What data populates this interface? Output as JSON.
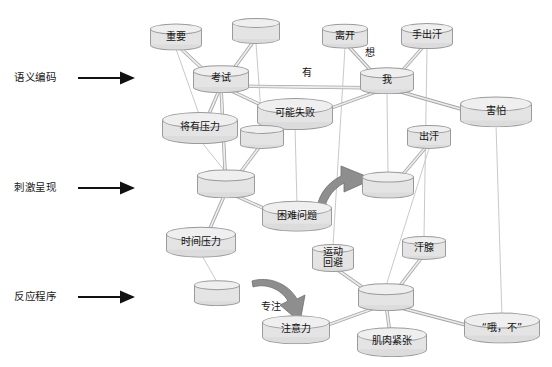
{
  "diagram": {
    "background": "#ffffff",
    "node_fill": "#e8e8e8",
    "node_stroke": "#9a9a9a",
    "edge_color": "#b9b9b9",
    "arrow_color": "#111111",
    "curved_arrow_fill": "#8c8c8c"
  },
  "stage_labels": [
    {
      "text": "语义编码",
      "x": 14,
      "y": 78
    },
    {
      "text": "刺激呈现",
      "x": 14,
      "y": 188
    },
    {
      "text": "反应程序",
      "x": 14,
      "y": 297
    }
  ],
  "arrows": [
    {
      "name": "stage-arrow-semantic-encoding",
      "x1": 78,
      "y1": 78,
      "x2": 133,
      "y2": 78
    },
    {
      "name": "stage-arrow-stimulus-presentation",
      "x1": 78,
      "y1": 188,
      "x2": 133,
      "y2": 188
    },
    {
      "name": "stage-arrow-response-procedure",
      "x1": 78,
      "y1": 297,
      "x2": 133,
      "y2": 297
    }
  ],
  "nodes": [
    {
      "id": "n_important",
      "label": "重要",
      "x": 176,
      "y": 37,
      "rx": 26,
      "h": 16
    },
    {
      "id": "n_blank_top",
      "label": "",
      "x": 256,
      "y": 31,
      "rx": 24,
      "h": 16
    },
    {
      "id": "n_leave",
      "label": "离开",
      "x": 345,
      "y": 36,
      "rx": 23,
      "h": 15
    },
    {
      "id": "n_sweatyhand",
      "label": "手出汗",
      "x": 427,
      "y": 36,
      "rx": 26,
      "h": 15
    },
    {
      "id": "n_exam",
      "label": "考试",
      "x": 221,
      "y": 79,
      "rx": 28,
      "h": 16
    },
    {
      "id": "n_me",
      "label": "我",
      "x": 387,
      "y": 81,
      "rx": 27,
      "h": 16
    },
    {
      "id": "n_mayfail",
      "label": "可能失败",
      "x": 295,
      "y": 114,
      "rx": 38,
      "h": 16
    },
    {
      "id": "n_afraid",
      "label": "害怕",
      "x": 496,
      "y": 112,
      "rx": 36,
      "h": 16
    },
    {
      "id": "n_pressure",
      "label": "将有压力",
      "x": 200,
      "y": 128,
      "rx": 38,
      "h": 16
    },
    {
      "id": "n_blank_mid1",
      "label": "",
      "x": 262,
      "y": 137,
      "rx": 22,
      "h": 15
    },
    {
      "id": "n_sweat",
      "label": "出汗",
      "x": 429,
      "y": 137,
      "rx": 22,
      "h": 15
    },
    {
      "id": "n_blank_mid2",
      "label": "",
      "x": 226,
      "y": 184,
      "rx": 29,
      "h": 17
    },
    {
      "id": "n_blank_mid3",
      "label": "",
      "x": 388,
      "y": 185,
      "rx": 26,
      "h": 16
    },
    {
      "id": "n_hardprob",
      "label": "困难问题",
      "x": 297,
      "y": 216,
      "rx": 35,
      "h": 16
    },
    {
      "id": "n_timepress",
      "label": "时间压力",
      "x": 201,
      "y": 242,
      "rx": 35,
      "h": 16
    },
    {
      "id": "n_avoid",
      "label": "运动\n回避",
      "x": 333,
      "y": 258,
      "rx": 21,
      "h": 19
    },
    {
      "id": "n_sweatgland",
      "label": "汗腺",
      "x": 424,
      "y": 248,
      "rx": 22,
      "h": 15
    },
    {
      "id": "n_blank_bot",
      "label": "",
      "x": 217,
      "y": 293,
      "rx": 23,
      "h": 16
    },
    {
      "id": "n_blank_hub",
      "label": "",
      "x": 386,
      "y": 297,
      "rx": 28,
      "h": 16
    },
    {
      "id": "n_attention",
      "label": "注意力",
      "x": 296,
      "y": 330,
      "rx": 34,
      "h": 15
    },
    {
      "id": "n_muscle",
      "label": "肌肉紧张",
      "x": 392,
      "y": 342,
      "rx": 35,
      "h": 15
    },
    {
      "id": "n_ohno",
      "label": "“哦，不”",
      "x": 502,
      "y": 328,
      "rx": 38,
      "h": 15
    }
  ],
  "edges": [
    {
      "from": "n_important",
      "to": "n_exam"
    },
    {
      "from": "n_blank_top",
      "to": "n_exam"
    },
    {
      "from": "n_exam",
      "to": "n_me"
    },
    {
      "from": "n_leave",
      "to": "n_me"
    },
    {
      "from": "n_sweatyhand",
      "to": "n_me"
    },
    {
      "from": "n_exam",
      "to": "n_mayfail"
    },
    {
      "from": "n_mayfail",
      "to": "n_me"
    },
    {
      "from": "n_me",
      "to": "n_afraid"
    },
    {
      "from": "n_exam",
      "to": "n_pressure"
    },
    {
      "from": "n_exam",
      "to": "n_blank_mid2"
    },
    {
      "from": "n_blank_mid1",
      "to": "n_blank_mid2"
    },
    {
      "from": "n_blank_mid2",
      "to": "n_hardprob"
    },
    {
      "from": "n_blank_mid2",
      "to": "n_timepress"
    },
    {
      "from": "n_blank_mid3",
      "to": "n_sweat"
    },
    {
      "from": "n_avoid",
      "to": "n_blank_hub"
    },
    {
      "from": "n_sweatgland",
      "to": "n_blank_hub"
    },
    {
      "from": "n_blank_hub",
      "to": "n_attention"
    },
    {
      "from": "n_blank_hub",
      "to": "n_muscle"
    },
    {
      "from": "n_blank_hub",
      "to": "n_ohno"
    }
  ],
  "vertical_links": [
    {
      "from": "n_important",
      "to": "n_pressure"
    },
    {
      "from": "n_blank_top",
      "to": "n_blank_mid1"
    },
    {
      "from": "n_leave",
      "to": "n_avoid"
    },
    {
      "from": "n_sweatyhand",
      "to": "n_sweatgland"
    },
    {
      "from": "n_mayfail",
      "to": "n_hardprob"
    },
    {
      "from": "n_me",
      "to": "n_blank_mid3"
    },
    {
      "from": "n_afraid",
      "to": "n_ohno"
    },
    {
      "from": "n_pressure",
      "to": "n_blank_mid2"
    },
    {
      "from": "n_sweat",
      "to": "n_blank_hub"
    },
    {
      "from": "n_timepress",
      "to": "n_blank_bot"
    },
    {
      "from": "n_exam",
      "to": "n_blank_mid2"
    }
  ],
  "edge_labels": [
    {
      "text": "有",
      "x": 307,
      "y": 73
    },
    {
      "text": "想",
      "x": 370,
      "y": 53
    }
  ],
  "curved_arrows": [
    {
      "name": "curved-arrow-stimulus",
      "label": "",
      "path": "M 322 212 C 330 196 338 184 352 176",
      "label_x": 0,
      "label_y": 0
    },
    {
      "name": "curved-arrow-focus",
      "label": "专注",
      "label_x": 271,
      "label_y": 307
    }
  ]
}
